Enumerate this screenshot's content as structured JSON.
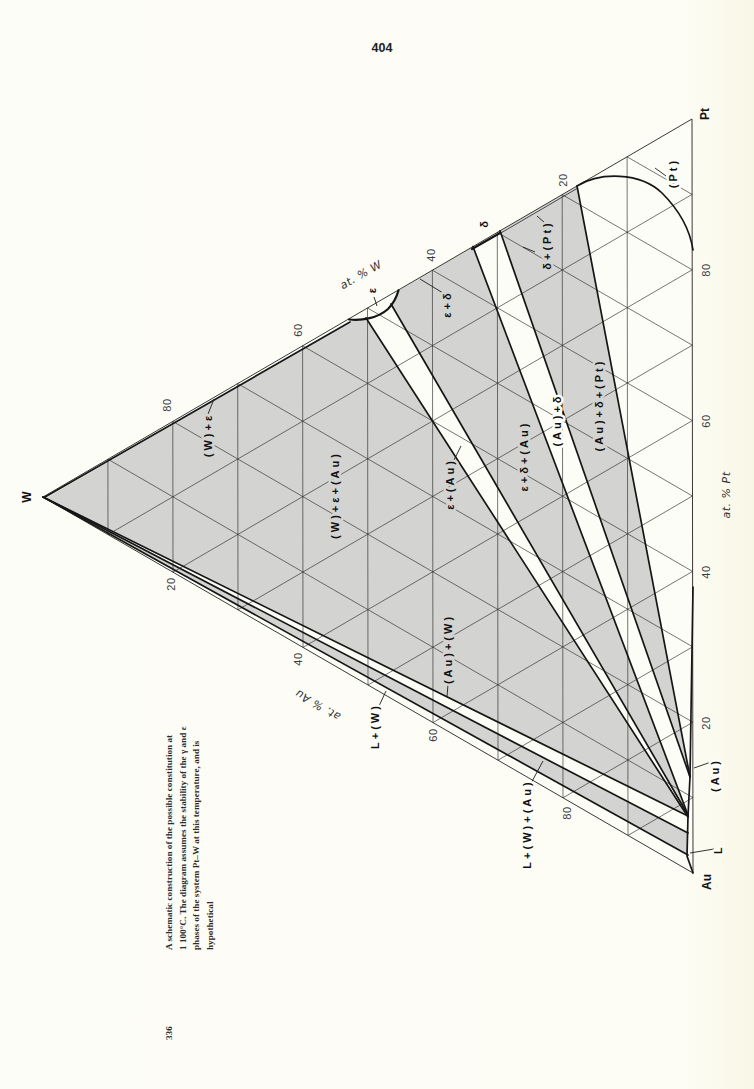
{
  "page": {
    "number": "404"
  },
  "colors": {
    "background": "#fdfdf7",
    "phase_region_fill": "#d3d3d1",
    "line": "#161616"
  },
  "diagram": {
    "type": "ternary isothermal section",
    "vertices": {
      "w": "W",
      "pt": "Pt",
      "au": "Au"
    },
    "axes": {
      "pt": {
        "title": "at. % Pt",
        "ticks": [
          "20",
          "40",
          "60",
          "80"
        ]
      },
      "w": {
        "title": "at. % W",
        "ticks": [
          "20",
          "40",
          "60",
          "80"
        ]
      },
      "au": {
        "title": "at. % Au",
        "ticks": [
          "20",
          "40",
          "60",
          "80"
        ]
      }
    },
    "grid_step_percent": 10,
    "phase_labels": {
      "w_eps": "(W)+ε",
      "w_eps_au": "(W)+ε+(Au)",
      "eps_au": "ε+(Au)",
      "eps_delta_au": "ε+δ+(Au)",
      "au_delta": "(Au)+δ",
      "au_delta_pt": "(Au)+δ+(Pt)",
      "delta_pt": "δ+(Pt)",
      "eps_delta": "ε+δ",
      "pt": "(Pt)",
      "eps": "ε",
      "delta": "δ",
      "au_w": "(Au)+(W)",
      "l_w": "L+(W)",
      "l_w_au": "L+(W)+(Au)",
      "au": "(Au)",
      "l": "L"
    }
  },
  "caption": {
    "number": "336",
    "lines": [
      "A schematic construction of the possible constitution at",
      "1 100°C. The diagram assumes the stability of the γ and ε",
      "phases of the system Pt–W at this temperature, and is",
      "hypothetical"
    ]
  }
}
